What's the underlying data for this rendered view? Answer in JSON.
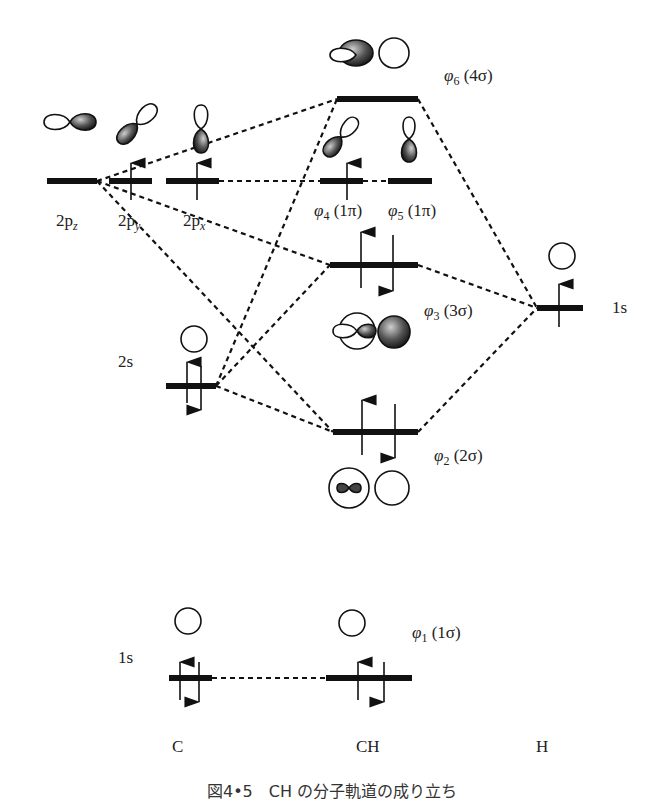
{
  "figure": {
    "caption": "図4•5　CH の分子軌道の成り立ち",
    "columns": {
      "left": "C",
      "middle": "CH",
      "right": "H"
    }
  },
  "atomic_orbitals_C": [
    {
      "id": "2pz",
      "label_main": "2p",
      "label_sub": "z",
      "electrons": 0
    },
    {
      "id": "2py",
      "label_main": "2p",
      "label_sub": "y",
      "electrons": 1
    },
    {
      "id": "2px",
      "label_main": "2p",
      "label_sub": "x",
      "electrons": 1
    },
    {
      "id": "2s",
      "label": "2s",
      "electrons": 2
    },
    {
      "id": "1s",
      "label": "1s",
      "electrons": 2
    }
  ],
  "atomic_orbitals_H": [
    {
      "id": "1s",
      "label": "1s",
      "electrons": 1
    }
  ],
  "molecular_orbitals": [
    {
      "id": "phi6",
      "phi": "φ",
      "sub": "6",
      "sym": "(4σ)",
      "electrons": 0
    },
    {
      "id": "phi4",
      "phi": "φ",
      "sub": "4",
      "sym": "(1π)",
      "electrons": 1
    },
    {
      "id": "phi5",
      "phi": "φ",
      "sub": "5",
      "sym": "(1π)",
      "electrons": 0
    },
    {
      "id": "phi3",
      "phi": "φ",
      "sub": "3",
      "sym": "(3σ)",
      "electrons": 2
    },
    {
      "id": "phi2",
      "phi": "φ",
      "sub": "2",
      "sym": "(2σ)",
      "electrons": 2
    },
    {
      "id": "phi1",
      "phi": "φ",
      "sub": "1",
      "sym": "(1σ)",
      "electrons": 2
    }
  ],
  "colors": {
    "ink": "#111111",
    "text": "#222222",
    "background": "#ffffff"
  }
}
